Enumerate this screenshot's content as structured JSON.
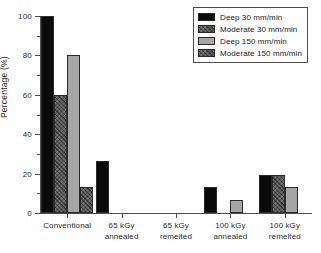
{
  "chart_data": {
    "type": "bar",
    "title": "",
    "subtitle": "",
    "xlabel": "",
    "ylabel": "Percentage (%)",
    "ylim": [
      0,
      100
    ],
    "yticks": [
      0,
      20,
      40,
      60,
      80,
      100
    ],
    "ytick_labels": [
      "0",
      "20",
      "40",
      "60",
      "80",
      "100"
    ],
    "grid": false,
    "legend_position": "top-right",
    "categories": [
      "Conventional",
      "65 kGy\nannealed",
      "65 kGy\nremelted",
      "100 kGy\nannealed",
      "100 kGy\nremelted"
    ],
    "series": [
      {
        "name": "Deep 30 mm/min",
        "color": "#0a0a0a",
        "values": [
          100,
          26.5,
          0,
          13,
          19.5
        ]
      },
      {
        "name": "Moderate 30 mm/min",
        "color": "#595959",
        "values": [
          60,
          0,
          0,
          0,
          19.5
        ]
      },
      {
        "name": "Deep 150 mm/min",
        "color": "#a6a6a6",
        "values": [
          80,
          0,
          0,
          6.5,
          13
        ]
      },
      {
        "name": "Moderate 150 mm/min",
        "color": "#595959",
        "values": [
          13.3,
          0,
          0,
          0,
          0
        ]
      }
    ]
  },
  "legend": {
    "items": [
      {
        "label": "Deep 30 mm/min"
      },
      {
        "label": "Moderate 30 mm/min"
      },
      {
        "label": "Deep 150 mm/min"
      },
      {
        "label": "Moderate 150 mm/min"
      }
    ]
  },
  "axes": {
    "y_title": "Percentage (%)"
  }
}
